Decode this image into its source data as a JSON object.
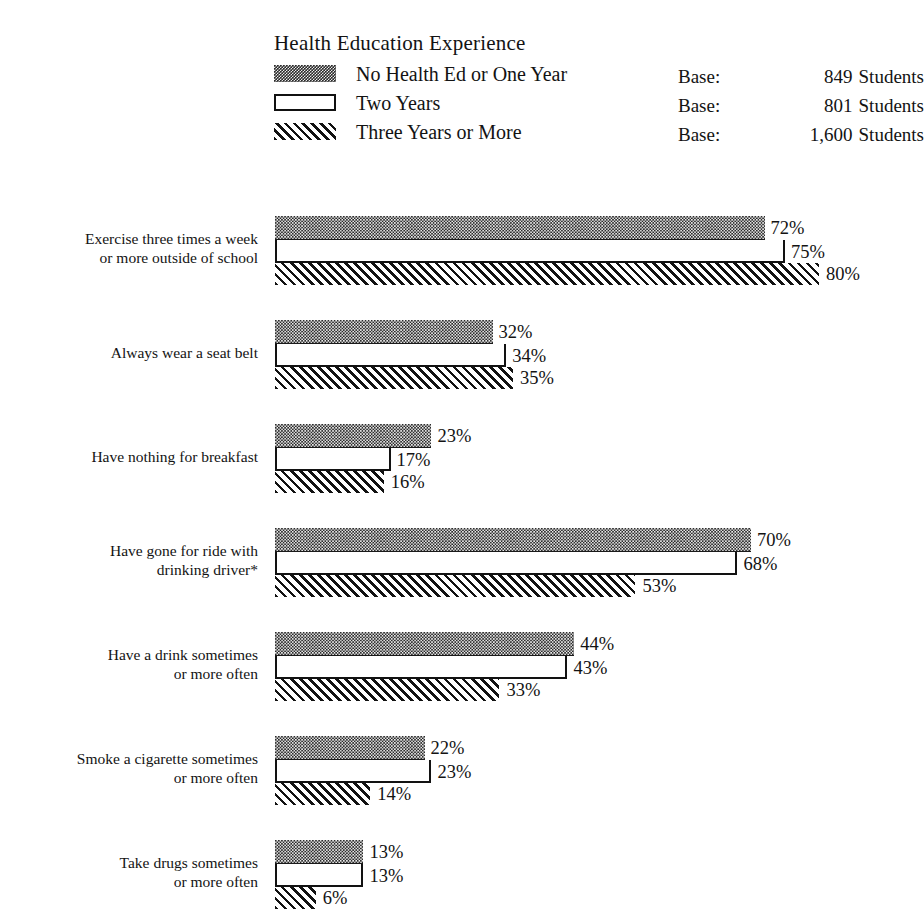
{
  "legend": {
    "title": "Health Education Experience",
    "rows": [
      {
        "swatch": "checkerboard-swatch",
        "label": "No Health Ed or One Year",
        "base_word": "Base:",
        "base_count": "849",
        "base_suffix": "Students"
      },
      {
        "swatch": "open-rectangle-swatch",
        "label": "Two Years",
        "base_word": "Base:",
        "base_count": "801",
        "base_suffix": "Students"
      },
      {
        "swatch": "diagonal-hatch-swatch",
        "label": "Three Years or More",
        "base_word": "Base:",
        "base_count": "1,600",
        "base_suffix": "Students"
      }
    ]
  },
  "chart_data": {
    "type": "bar",
    "title": "Health Education Experience",
    "orientation": "horizontal",
    "xlabel": "",
    "ylabel": "",
    "xlim": [
      0,
      100
    ],
    "grid": false,
    "legend_position": "top",
    "value_suffix": "%",
    "categories": [
      "Exercise three times a week\nor more outside of school",
      "Always wear a seat belt",
      "Have nothing for breakfast",
      "Have gone for ride with\ndrinking driver*",
      "Have a drink sometimes\nor more often",
      "Smoke a cigarette sometimes\nor more often",
      "Take drugs sometimes\nor more often"
    ],
    "series": [
      {
        "name": "No Health Ed or One Year",
        "base": "849 Students",
        "values": [
          72,
          32,
          23,
          70,
          44,
          22,
          13
        ],
        "labels": [
          "72%",
          "32%",
          "23%",
          "70%",
          "44%",
          "22%",
          "13%"
        ]
      },
      {
        "name": "Two Years",
        "base": "801 Students",
        "values": [
          75,
          34,
          17,
          68,
          43,
          23,
          13
        ],
        "labels": [
          "75%",
          "34%",
          "17%",
          "68%",
          "43%",
          "23%",
          "13%"
        ]
      },
      {
        "name": "Three Years or More",
        "base": "1,600 Students",
        "values": [
          80,
          35,
          16,
          53,
          33,
          14,
          6
        ],
        "labels": [
          "80%",
          "35%",
          "16%",
          "53%",
          "33%",
          "14%",
          "6%"
        ]
      }
    ]
  },
  "groups": [
    {
      "label": "Exercise three times a week\nor more outside of school",
      "bars": [
        {
          "series": "No Health Ed or One Year",
          "value": 72,
          "label": "72%"
        },
        {
          "series": "Two Years",
          "value": 75,
          "label": "75%"
        },
        {
          "series": "Three Years or More",
          "value": 80,
          "label": "80%"
        }
      ]
    },
    {
      "label": "Always wear a seat belt",
      "bars": [
        {
          "series": "No Health Ed or One Year",
          "value": 32,
          "label": "32%"
        },
        {
          "series": "Two Years",
          "value": 34,
          "label": "34%"
        },
        {
          "series": "Three Years or More",
          "value": 35,
          "label": "35%"
        }
      ]
    },
    {
      "label": "Have nothing for breakfast",
      "bars": [
        {
          "series": "No Health Ed or One Year",
          "value": 23,
          "label": "23%"
        },
        {
          "series": "Two Years",
          "value": 17,
          "label": "17%"
        },
        {
          "series": "Three Years or More",
          "value": 16,
          "label": "16%"
        }
      ]
    },
    {
      "label": "Have gone for ride with\ndrinking driver*",
      "bars": [
        {
          "series": "No Health Ed or One Year",
          "value": 70,
          "label": "70%"
        },
        {
          "series": "Two Years",
          "value": 68,
          "label": "68%"
        },
        {
          "series": "Three Years or More",
          "value": 53,
          "label": "53%"
        }
      ]
    },
    {
      "label": "Have a drink sometimes\nor more often",
      "bars": [
        {
          "series": "No Health Ed or One Year",
          "value": 44,
          "label": "44%"
        },
        {
          "series": "Two Years",
          "value": 43,
          "label": "43%"
        },
        {
          "series": "Three Years or More",
          "value": 33,
          "label": "33%"
        }
      ]
    },
    {
      "label": "Smoke a cigarette sometimes\nor more often",
      "bars": [
        {
          "series": "No Health Ed or One Year",
          "value": 22,
          "label": "22%"
        },
        {
          "series": "Two Years",
          "value": 23,
          "label": "23%"
        },
        {
          "series": "Three Years or More",
          "value": 14,
          "label": "14%"
        }
      ]
    },
    {
      "label": "Take drugs sometimes\nor more often",
      "bars": [
        {
          "series": "No Health Ed or One Year",
          "value": 13,
          "label": "13%"
        },
        {
          "series": "Two Years",
          "value": 13,
          "label": "13%"
        },
        {
          "series": "Three Years or More",
          "value": 6,
          "label": "6%"
        }
      ]
    }
  ],
  "scale": {
    "px_per_percent": 6.8,
    "bar_left_px": 275
  },
  "colors": {
    "ink": "#131313",
    "background": "#ffffff"
  }
}
